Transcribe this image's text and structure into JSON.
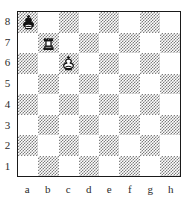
{
  "board": {
    "files": [
      "a",
      "b",
      "c",
      "d",
      "e",
      "f",
      "g",
      "h"
    ],
    "ranks": [
      "8",
      "7",
      "6",
      "5",
      "4",
      "3",
      "2",
      "1"
    ],
    "light_square_color": "#ffffff",
    "dark_square_color": "#7d7d7d",
    "border_color": "#1a1a1a",
    "dark_corner_square": "a8",
    "orientation": "white-bottom",
    "pieces": [
      {
        "square": "a8",
        "file": "a",
        "rank": "8",
        "color": "black",
        "type": "king",
        "icon": "black-king-icon",
        "symbol": "♚"
      },
      {
        "square": "b7",
        "file": "b",
        "rank": "7",
        "color": "white",
        "type": "rook",
        "icon": "white-rook-icon",
        "symbol": "♖"
      },
      {
        "square": "c6",
        "file": "c",
        "rank": "6",
        "color": "white",
        "type": "king",
        "icon": "white-king-icon",
        "symbol": "♔"
      }
    ]
  }
}
